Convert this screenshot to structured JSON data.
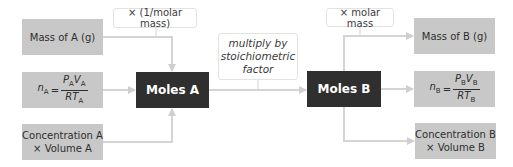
{
  "colors": {
    "gray_box": "#c8c8c8",
    "dark_box": "#2f2f2f",
    "arrow": "#d0d0d0",
    "label_border": "#e2e2e2"
  },
  "left": {
    "mass": "Mass of A (g)",
    "gas": {
      "lhs": "n",
      "lhs_sub": "A",
      "eq": "=",
      "num_p": "P",
      "num_p_sub": "A",
      "num_v": "V",
      "num_v_sub": "A",
      "den_rt": "RT",
      "den_sub": "A"
    },
    "conc_line1": "Concentration A",
    "conc_line2": "× Volume A"
  },
  "center": {
    "moles_a": "Moles A",
    "moles_b": "Moles B"
  },
  "labels": {
    "inv_molar_mass": "× (1/molar mass)",
    "stoich_line1": "multiply by",
    "stoich_line2": "stoichiometric",
    "stoich_line3": "factor",
    "molar_mass": "× molar mass"
  },
  "right": {
    "mass": "Mass of B (g)",
    "gas": {
      "lhs": "n",
      "lhs_sub": "B",
      "eq": "=",
      "num_p": "P",
      "num_p_sub": "B",
      "num_v": "V",
      "num_v_sub": "B",
      "den_rt": "RT",
      "den_sub": "B"
    },
    "conc_line1": "Concentration B",
    "conc_line2": "× Volume B"
  }
}
